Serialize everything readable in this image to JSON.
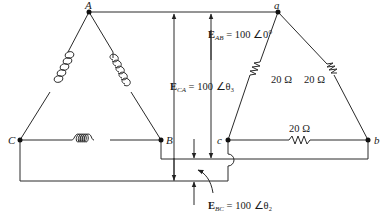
{
  "diagram": {
    "type": "three-phase delta-delta circuit",
    "nodes": {
      "A": "A",
      "B": "B",
      "C": "C",
      "a": "a",
      "b": "b",
      "c": "c"
    },
    "source": {
      "description": "delta-connected generator with three coils",
      "coils": [
        "A-C coil",
        "A-B coil",
        "C-B coil"
      ]
    },
    "load": {
      "description": "delta-connected resistive load",
      "resistors": [
        {
          "branch": "a-c",
          "value": "20 Ω"
        },
        {
          "branch": "a-b",
          "value": "20 Ω"
        },
        {
          "branch": "c-b",
          "value": "20 Ω"
        }
      ]
    },
    "voltages": {
      "E_AB": {
        "symbol": "E",
        "subscript": "AB",
        "value": "= 100 ∠0°"
      },
      "E_CA": {
        "symbol": "E",
        "subscript": "CA",
        "value": "= 100 ∠θ₃"
      },
      "E_BC": {
        "symbol": "E",
        "subscript": "BC",
        "value": "= 100 ∠θ₂"
      }
    },
    "colors": {
      "line": "#2a2a2a",
      "background": "#ffffff"
    }
  }
}
